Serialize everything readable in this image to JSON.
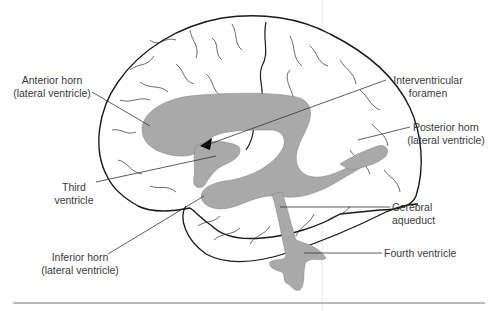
{
  "diagram": {
    "colors": {
      "outline": "#1a1a1a",
      "ventricle_fill": "#a9a9a9",
      "sulci": "#2a2a2a",
      "leader": "#333333",
      "text": "#3a3a3a",
      "rule": "#777777"
    },
    "labels": {
      "anterior_horn": {
        "line1": "Anterior horn",
        "line2": "(lateral ventricle)"
      },
      "third_ventricle": {
        "line1": "Third",
        "line2": "ventricle"
      },
      "inferior_horn": {
        "line1": "Inferior horn",
        "line2": "(lateral ventricle)"
      },
      "interventricular_foramen": {
        "line1": "Interventricular",
        "line2": "foramen"
      },
      "posterior_horn": {
        "line1": "Posterior horn",
        "line2": "(lateral ventricle)"
      },
      "cerebral_aqueduct": {
        "line1": "Cerebral",
        "line2": "aqueduct"
      },
      "fourth_ventricle": {
        "line1": "Fourth ventricle"
      }
    }
  }
}
